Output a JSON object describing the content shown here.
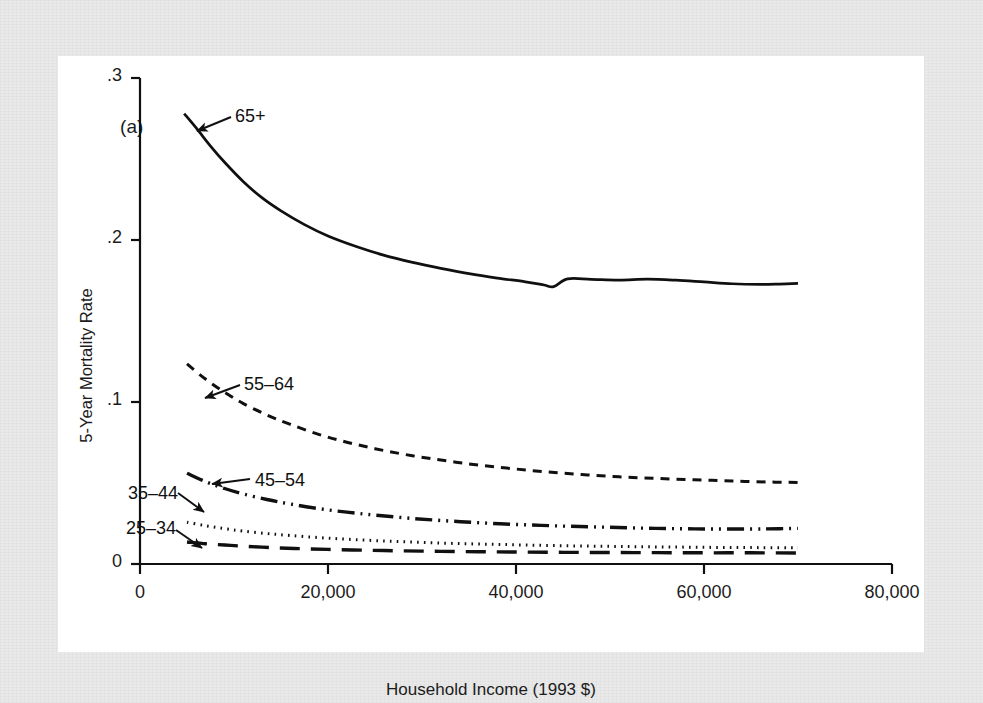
{
  "figure": {
    "panel_label": "(a)",
    "background_color": "#e9e9e9",
    "panel_color": "#ffffff",
    "ink_color": "#101010"
  },
  "chart_data": {
    "type": "line",
    "title": "",
    "subtitle": "",
    "xlabel": "Household Income (1993 $)",
    "ylabel": "5-Year Mortality Rate",
    "xlim": [
      0,
      80000
    ],
    "ylim": [
      0,
      0.3
    ],
    "xticks": [
      0,
      20000,
      40000,
      60000,
      80000
    ],
    "xticklabels": [
      "0",
      "20,000",
      "40,000",
      "60,000",
      "80,000"
    ],
    "yticks": [
      0,
      0.1,
      0.2,
      0.3
    ],
    "yticklabels": [
      "0",
      ".1",
      ".2",
      ".3"
    ],
    "grid": false,
    "legend": "inline-annotations",
    "annotations": [
      {
        "text": "65+",
        "label_x": 235,
        "label_y": 106,
        "arrow_from_x": 231,
        "arrow_from_y": 117,
        "arrow_to_x": 197,
        "arrow_to_y": 131
      },
      {
        "text": "55–64",
        "label_x": 244,
        "label_y": 374,
        "arrow_from_x": 240,
        "arrow_from_y": 385,
        "arrow_to_x": 205,
        "arrow_to_y": 398
      },
      {
        "text": "45–54",
        "label_x": 255,
        "label_y": 470,
        "arrow_from_x": 250,
        "arrow_from_y": 479,
        "arrow_to_x": 212,
        "arrow_to_y": 484
      },
      {
        "text": "35–44",
        "label_x": 128,
        "label_y": 483,
        "arrow_from_x": 178,
        "arrow_from_y": 493,
        "arrow_to_x": 204,
        "arrow_to_y": 512
      },
      {
        "text": "25–34",
        "label_x": 126,
        "label_y": 518,
        "arrow_from_x": 176,
        "arrow_from_y": 530,
        "arrow_to_x": 202,
        "arrow_to_y": 548
      }
    ],
    "series": [
      {
        "name": "65+",
        "style": "solid",
        "x": [
          4700,
          6000,
          7500,
          9000,
          11000,
          13000,
          15000,
          17500,
          20000,
          23000,
          26000,
          29000,
          32000,
          35000,
          38000,
          41000,
          43000,
          44000,
          45500,
          48000,
          51000,
          54000,
          57000,
          60000,
          63000,
          66000,
          68000,
          70000
        ],
        "y": [
          0.278,
          0.269,
          0.258,
          0.248,
          0.236,
          0.226,
          0.218,
          0.2095,
          0.2025,
          0.196,
          0.1905,
          0.1862,
          0.1825,
          0.1792,
          0.1765,
          0.1742,
          0.1722,
          0.1712,
          0.176,
          0.1757,
          0.1752,
          0.1758,
          0.1752,
          0.1741,
          0.173,
          0.1726,
          0.1728,
          0.1732
        ]
      },
      {
        "name": "55–64",
        "style": "dashed-short",
        "x": [
          5000,
          7000,
          9000,
          11000,
          13500,
          16000,
          19000,
          22000,
          25000,
          28000,
          31000,
          35000,
          39000,
          43000,
          47000,
          51000,
          55000,
          59000,
          63000,
          67000,
          70000
        ],
        "y": [
          0.1235,
          0.114,
          0.106,
          0.099,
          0.092,
          0.0862,
          0.08,
          0.0752,
          0.0712,
          0.0678,
          0.065,
          0.0618,
          0.0592,
          0.057,
          0.0552,
          0.0538,
          0.0528,
          0.052,
          0.0512,
          0.0506,
          0.0503
        ]
      },
      {
        "name": "45–54",
        "style": "dash-dot-dot",
        "x": [
          5000,
          7000,
          9000,
          11000,
          13500,
          16000,
          19000,
          22000,
          25000,
          29000,
          33000,
          37000,
          41000,
          45000,
          49000,
          53000,
          57000,
          61000,
          65000,
          68000,
          70000
        ],
        "y": [
          0.056,
          0.0508,
          0.0466,
          0.0432,
          0.0398,
          0.037,
          0.0342,
          0.032,
          0.0302,
          0.0281,
          0.0265,
          0.0252,
          0.0242,
          0.0234,
          0.0228,
          0.0222,
          0.0218,
          0.0216,
          0.0216,
          0.0218,
          0.022
        ]
      },
      {
        "name": "35–44",
        "style": "dotted",
        "x": [
          5000,
          7000,
          9000,
          11000,
          13500,
          16000,
          19000,
          22000,
          26000,
          30000,
          34000,
          38000,
          42000,
          46000,
          50000,
          54000,
          58000,
          62000,
          66000,
          70000
        ],
        "y": [
          0.0258,
          0.0236,
          0.0218,
          0.0203,
          0.0188,
          0.0176,
          0.0163,
          0.0153,
          0.0142,
          0.0133,
          0.0126,
          0.0121,
          0.0116,
          0.0112,
          0.0109,
          0.0106,
          0.0104,
          0.0102,
          0.0101,
          0.01
        ]
      },
      {
        "name": "25–34",
        "style": "dashed-long",
        "x": [
          5000,
          7000,
          9000,
          11000,
          14000,
          17000,
          20000,
          24000,
          28000,
          32000,
          36000,
          40000,
          45000,
          50000,
          55000,
          60000,
          65000,
          70000
        ],
        "y": [
          0.0136,
          0.0125,
          0.0117,
          0.011,
          0.0101,
          0.0095,
          0.009,
          0.0085,
          0.0081,
          0.0078,
          0.0076,
          0.0074,
          0.0072,
          0.0071,
          0.007,
          0.0069,
          0.0069,
          0.0068
        ]
      }
    ]
  }
}
